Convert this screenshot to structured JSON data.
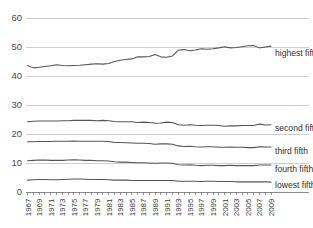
{
  "chart_data": {
    "type": "line",
    "title": "",
    "subtitle": "",
    "xlabel": "",
    "ylabel": "",
    "xlim": [
      1967,
      2009
    ],
    "ylim": [
      0,
      63
    ],
    "yticks": [
      0,
      10,
      20,
      30,
      40,
      50,
      60
    ],
    "ytick_labels": [
      "0",
      "10",
      "20",
      "30",
      "40",
      "50",
      "60"
    ],
    "grid": true,
    "legend_position": "right-inline",
    "x": [
      1967,
      1968,
      1969,
      1970,
      1971,
      1972,
      1973,
      1974,
      1975,
      1976,
      1977,
      1978,
      1979,
      1980,
      1981,
      1982,
      1983,
      1984,
      1985,
      1986,
      1987,
      1988,
      1989,
      1990,
      1991,
      1992,
      1993,
      1994,
      1995,
      1996,
      1997,
      1998,
      1999,
      2000,
      2001,
      2002,
      2003,
      2004,
      2005,
      2006,
      2007,
      2008,
      2009
    ],
    "xtick_labels": [
      "1967",
      "1969",
      "1971",
      "1973",
      "1975",
      "1977",
      "1979",
      "1981",
      "1983",
      "1985",
      "1987",
      "1989",
      "1991",
      "1993",
      "1995",
      "1997",
      "1999",
      "2001",
      "2003",
      "2005",
      "2007",
      "2009"
    ],
    "series": [
      {
        "name": "highest fifth",
        "label": "highest fifth",
        "color": "#555555",
        "values": [
          43.6,
          42.8,
          43.0,
          43.3,
          43.5,
          43.9,
          43.6,
          43.5,
          43.6,
          43.7,
          43.9,
          44.1,
          44.2,
          44.1,
          44.3,
          45.0,
          45.4,
          45.7,
          45.9,
          46.6,
          46.6,
          46.7,
          47.4,
          46.6,
          46.5,
          46.9,
          48.9,
          49.1,
          48.7,
          49.0,
          49.4,
          49.2,
          49.4,
          49.7,
          50.1,
          49.7,
          49.8,
          50.1,
          50.4,
          50.5,
          49.7,
          50.0,
          50.3
        ]
      },
      {
        "name": "second fifth",
        "label": "second fifth",
        "color": "#555555",
        "values": [
          24.2,
          24.4,
          24.5,
          24.5,
          24.5,
          24.5,
          24.6,
          24.6,
          24.7,
          24.7,
          24.7,
          24.7,
          24.6,
          24.7,
          24.6,
          24.3,
          24.2,
          24.2,
          24.2,
          24.0,
          24.1,
          24.0,
          23.7,
          23.8,
          24.1,
          24.0,
          23.2,
          23.0,
          23.2,
          23.0,
          22.9,
          23.0,
          23.0,
          22.9,
          22.7,
          22.8,
          22.8,
          22.9,
          22.9,
          22.9,
          23.4,
          23.1,
          23.2
        ]
      },
      {
        "name": "third fifth",
        "label": "third fifth",
        "color": "#555555",
        "values": [
          17.3,
          17.3,
          17.4,
          17.4,
          17.4,
          17.5,
          17.5,
          17.5,
          17.6,
          17.5,
          17.5,
          17.5,
          17.5,
          17.5,
          17.4,
          17.1,
          17.1,
          17.0,
          16.9,
          16.8,
          16.8,
          16.7,
          16.5,
          16.6,
          16.6,
          16.5,
          15.9,
          15.7,
          15.8,
          15.6,
          15.5,
          15.6,
          15.6,
          15.4,
          15.4,
          15.5,
          15.4,
          15.4,
          15.3,
          15.3,
          15.6,
          15.5,
          15.5
        ]
      },
      {
        "name": "fourth fifth",
        "label": "fourth fifth",
        "color": "#555555",
        "values": [
          10.8,
          10.9,
          11.0,
          11.0,
          10.9,
          10.9,
          10.9,
          11.0,
          11.1,
          11.0,
          10.9,
          10.9,
          10.8,
          10.8,
          10.7,
          10.4,
          10.3,
          10.3,
          10.2,
          10.1,
          10.1,
          10.0,
          9.9,
          10.0,
          10.0,
          9.9,
          9.4,
          9.3,
          9.4,
          9.2,
          9.1,
          9.2,
          9.2,
          9.1,
          9.1,
          9.2,
          9.1,
          9.1,
          9.1,
          9.1,
          9.3,
          9.3,
          9.3
        ]
      },
      {
        "name": "lowest fifth",
        "label": "lowest fifth",
        "color": "#555555",
        "values": [
          4.1,
          4.2,
          4.3,
          4.3,
          4.2,
          4.2,
          4.3,
          4.4,
          4.5,
          4.5,
          4.4,
          4.3,
          4.3,
          4.3,
          4.2,
          4.1,
          4.1,
          4.1,
          4.0,
          4.0,
          4.0,
          4.0,
          4.0,
          4.0,
          4.0,
          4.0,
          3.7,
          3.7,
          3.7,
          3.7,
          3.6,
          3.7,
          3.7,
          3.6,
          3.6,
          3.6,
          3.5,
          3.5,
          3.5,
          3.5,
          3.5,
          3.5,
          3.4
        ]
      }
    ]
  },
  "axis": {
    "y_tick_labels": [
      "60",
      "50",
      "40",
      "30",
      "20",
      "10",
      "0"
    ]
  },
  "labels": {
    "highest_fifth": "highest fifth",
    "second_fifth": "second fifth",
    "third_fifth": "third fifth",
    "fourth_fifth": "fourth fifth",
    "lowest_fifth": "lowest fifth"
  }
}
